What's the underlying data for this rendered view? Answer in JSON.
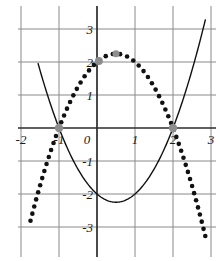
{
  "chart_data": {
    "type": "line",
    "title": "",
    "subtitle": "",
    "xlabel": "",
    "ylabel": "",
    "xlim": [
      -2.35,
      3.2
    ],
    "ylim": [
      -3.35,
      3.25
    ],
    "grid": true,
    "grid_color": "#8a8a8a",
    "axis_color": "#2b2b2b",
    "legend": "none",
    "x_ticks": [
      {
        "value": -2,
        "label": "-2"
      },
      {
        "value": -1,
        "label": "-1"
      },
      {
        "value": 0,
        "label": "0"
      },
      {
        "value": 1,
        "label": "1"
      },
      {
        "value": 2,
        "label": "2"
      },
      {
        "value": 3,
        "label": "3"
      }
    ],
    "y_ticks": [
      {
        "value": 3,
        "label": "3"
      },
      {
        "value": 2,
        "label": "2"
      },
      {
        "value": 1,
        "label": "1"
      },
      {
        "value": 0,
        "label": "0"
      },
      {
        "value": -1,
        "label": "-1"
      },
      {
        "value": -2,
        "label": "-2"
      },
      {
        "value": -3,
        "label": "-3"
      }
    ],
    "series": [
      {
        "name": "solid-parabola",
        "style": "solid",
        "color": "#111111",
        "equation": "y = x^2 - x - 2",
        "coefficients": {
          "a": 1,
          "b": -1,
          "c": -2
        },
        "vertex": [
          0.5,
          -2.25
        ],
        "roots": [
          -1,
          2
        ],
        "x_range": [
          -1.55,
          2.85
        ],
        "line_width": 1.4
      },
      {
        "name": "dotted-parabola",
        "style": "dotted",
        "color": "#111111",
        "equation": "y = -x^2 + x + 2",
        "coefficients": {
          "a": -1,
          "b": 1,
          "c": 2
        },
        "vertex": [
          0.5,
          2.25
        ],
        "roots": [
          -1,
          2
        ],
        "y_intercept": 2,
        "x_range": [
          -1.75,
          2.85
        ],
        "dot_radius": 2.3,
        "dot_count": 56
      }
    ],
    "markers": [
      {
        "name": "root-left",
        "x": -1,
        "y": 0,
        "color": "#8d8d8d",
        "radius": 4.2
      },
      {
        "name": "root-right",
        "x": 2,
        "y": 0,
        "color": "#8d8d8d",
        "radius": 4.2
      },
      {
        "name": "y-intercept",
        "x": 0.05,
        "y": 2.03,
        "color": "#8d8d8d",
        "radius": 4.0
      },
      {
        "name": "vertex-peak",
        "x": 0.5,
        "y": 2.25,
        "color": "#8d8d8d",
        "radius": 3.6
      }
    ]
  }
}
